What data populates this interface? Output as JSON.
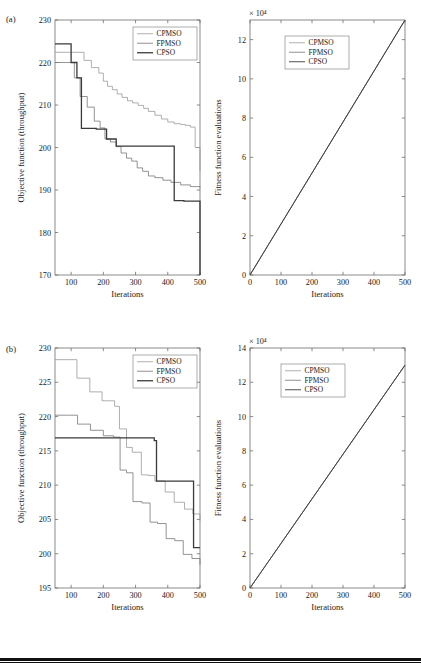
{
  "figure": {
    "panels": [
      {
        "tag": "(a)",
        "left": {
          "ylabel": "Objective function (throughput)",
          "xlabel": "Iterations",
          "xlim": [
            50,
            500
          ],
          "ylim": [
            170,
            230
          ],
          "xticks": [
            100,
            200,
            300,
            400,
            500
          ],
          "yticks": [
            170,
            180,
            190,
            200,
            210,
            220,
            230
          ],
          "legend": [
            "CPMSO",
            "FPMSO",
            "CPSO"
          ]
        },
        "right": {
          "ylabel": "Fitness function evaluations",
          "xlabel": "Iterations",
          "exponent": "× 10⁴",
          "xlim": [
            0,
            500
          ],
          "ylim": [
            0,
            13
          ],
          "xticks": [
            0,
            100,
            200,
            300,
            400,
            500
          ],
          "yticks": [
            0,
            2,
            4,
            6,
            8,
            10,
            12
          ],
          "legend": [
            "CPMSO",
            "FPMSO",
            "CPSO"
          ]
        }
      },
      {
        "tag": "(b)",
        "left": {
          "ylabel": "Objective function (throughput)",
          "xlabel": "Iterations",
          "xlim": [
            50,
            500
          ],
          "ylim": [
            195,
            230
          ],
          "xticks": [
            100,
            200,
            300,
            400,
            500
          ],
          "yticks": [
            195,
            200,
            205,
            210,
            215,
            220,
            225,
            230
          ],
          "legend": [
            "CPMSO",
            "FPMSO",
            "CPSO"
          ]
        },
        "right": {
          "ylabel": "Fitness function evaluations",
          "xlabel": "Iterations",
          "exponent": "× 10⁴",
          "xlim": [
            0,
            500
          ],
          "ylim": [
            0,
            14
          ],
          "xticks": [
            0,
            100,
            200,
            300,
            400,
            500
          ],
          "yticks": [
            0,
            2,
            4,
            6,
            8,
            10,
            12,
            14
          ],
          "legend": [
            "CPMSO",
            "FPMSO",
            "CPSO"
          ]
        }
      }
    ]
  },
  "colors": {
    "cpmso": "#9a9a9a",
    "fpmso": "#777777",
    "cpso": "#3a3a3a",
    "axis": "#6e6e6e",
    "text": "#1a1a1a",
    "rule": "#111111"
  },
  "chart_data": [
    {
      "id": "a-left",
      "type": "line",
      "title": "",
      "subtitle": "(a) convergence of objective function",
      "xlabel": "Iterations",
      "ylabel": "Objective function (throughput)",
      "xlim": [
        50,
        500
      ],
      "ylim": [
        170,
        230
      ],
      "xticks": [
        100,
        200,
        300,
        400,
        500
      ],
      "yticks": [
        170,
        180,
        190,
        200,
        210,
        220,
        230
      ],
      "grid": false,
      "legend_position": "top-right",
      "step": "post",
      "series": [
        {
          "name": "CPMSO",
          "color": "#9a9a9a",
          "linewidth": 0.8,
          "x": [
            50,
            88,
            140,
            163,
            186,
            200,
            213,
            228,
            243,
            258,
            275,
            291,
            308,
            325,
            340,
            360,
            380,
            400,
            420,
            440,
            455,
            470,
            485,
            500
          ],
          "y": [
            222.4,
            222.4,
            220.5,
            218.8,
            217.5,
            215.6,
            214.4,
            213.6,
            212.6,
            211.8,
            211.0,
            210.5,
            209.9,
            209.2,
            208.5,
            207.6,
            206.7,
            206.0,
            205.6,
            205.4,
            205.2,
            204.8,
            200.0,
            194.5
          ]
        },
        {
          "name": "FPMSO",
          "color": "#777777",
          "linewidth": 0.8,
          "x": [
            50,
            82,
            110,
            128,
            150,
            172,
            190,
            205,
            222,
            240,
            255,
            272,
            288,
            305,
            322,
            340,
            360,
            385,
            410,
            440,
            470,
            500
          ],
          "y": [
            220.0,
            220.0,
            216.4,
            212.0,
            209.5,
            206.2,
            204.6,
            202.0,
            201.3,
            200.2,
            198.7,
            197.5,
            196.8,
            195.2,
            194.4,
            193.3,
            192.9,
            192.3,
            191.8,
            191.2,
            190.8,
            190.5
          ]
        },
        {
          "name": "CPSO",
          "color": "#3a3a3a",
          "linewidth": 1.3,
          "x": [
            50,
            88,
            100,
            118,
            132,
            178,
            210,
            240,
            332,
            420,
            450,
            500
          ],
          "y": [
            224.4,
            224.4,
            220.0,
            216.4,
            204.5,
            204.3,
            202.0,
            200.3,
            200.3,
            187.5,
            187.4,
            170.0
          ]
        }
      ]
    },
    {
      "id": "a-right",
      "type": "line",
      "title": "",
      "subtitle": "(a) fitness function evaluations versus iterations",
      "xlabel": "Iterations",
      "ylabel": "Fitness function evaluations",
      "y_exponent": "× 10⁴",
      "xlim": [
        0,
        500
      ],
      "ylim": [
        0,
        13
      ],
      "xticks": [
        0,
        100,
        200,
        300,
        400,
        500
      ],
      "yticks": [
        0,
        2,
        4,
        6,
        8,
        10,
        12
      ],
      "grid": false,
      "legend_position": "upper-left-inset",
      "series": [
        {
          "name": "CPMSO",
          "color": "#9a9a9a",
          "linewidth": 0.8,
          "x": [
            0,
            500
          ],
          "y": [
            0,
            13.0
          ]
        },
        {
          "name": "FPMSO",
          "color": "#777777",
          "linewidth": 0.8,
          "x": [
            0,
            500
          ],
          "y": [
            0,
            13.0
          ]
        },
        {
          "name": "CPSO",
          "color": "#3a3a3a",
          "linewidth": 0.9,
          "x": [
            0,
            500
          ],
          "y": [
            0,
            13.0
          ]
        }
      ]
    },
    {
      "id": "b-left",
      "type": "line",
      "title": "",
      "subtitle": "(b) convergence of objective function",
      "xlabel": "Iterations",
      "ylabel": "Objective function (throughput)",
      "xlim": [
        50,
        500
      ],
      "ylim": [
        195,
        230
      ],
      "xticks": [
        100,
        200,
        300,
        400,
        500
      ],
      "yticks": [
        195,
        200,
        205,
        210,
        215,
        220,
        225,
        230
      ],
      "grid": false,
      "legend_position": "top-right",
      "step": "post",
      "series": [
        {
          "name": "CPMSO",
          "color": "#9a9a9a",
          "linewidth": 0.8,
          "x": [
            50,
            90,
            118,
            158,
            196,
            235,
            250,
            272,
            290,
            318,
            340,
            360,
            392,
            420,
            452,
            478,
            500
          ],
          "y": [
            228.3,
            228.3,
            225.6,
            223.6,
            222.3,
            221.5,
            218.2,
            215.5,
            214.8,
            211.5,
            211.4,
            210.6,
            209.0,
            207.5,
            206.5,
            205.8,
            204.8
          ]
        },
        {
          "name": "FPMSO",
          "color": "#777777",
          "linewidth": 0.8,
          "x": [
            50,
            92,
            120,
            160,
            200,
            232,
            252,
            272,
            292,
            320,
            345,
            368,
            395,
            422,
            448,
            475,
            500
          ],
          "y": [
            220.2,
            220.2,
            218.9,
            218.0,
            217.2,
            217.0,
            212.2,
            211.8,
            207.6,
            207.4,
            204.6,
            204.4,
            202.2,
            201.9,
            199.9,
            199.3,
            198.4
          ]
        },
        {
          "name": "CPSO",
          "color": "#3a3a3a",
          "linewidth": 1.3,
          "x": [
            50,
            355,
            358,
            365,
            478,
            480,
            500
          ],
          "y": [
            216.9,
            216.9,
            216.5,
            210.6,
            210.6,
            200.9,
            200.9
          ]
        }
      ]
    },
    {
      "id": "b-right",
      "type": "line",
      "title": "",
      "subtitle": "(b) fitness function evaluations versus iterations",
      "xlabel": "Iterations",
      "ylabel": "Fitness function evaluations",
      "y_exponent": "× 10⁴",
      "xlim": [
        0,
        500
      ],
      "ylim": [
        0,
        14
      ],
      "xticks": [
        0,
        100,
        200,
        300,
        400,
        500
      ],
      "yticks": [
        0,
        2,
        4,
        6,
        8,
        10,
        12,
        14
      ],
      "grid": false,
      "legend_position": "upper-left-inset",
      "series": [
        {
          "name": "CPMSO",
          "color": "#9a9a9a",
          "linewidth": 0.8,
          "x": [
            0,
            500
          ],
          "y": [
            0,
            13.0
          ]
        },
        {
          "name": "FPMSO",
          "color": "#777777",
          "linewidth": 0.8,
          "x": [
            0,
            500
          ],
          "y": [
            0,
            13.0
          ]
        },
        {
          "name": "CPSO",
          "color": "#3a3a3a",
          "linewidth": 0.9,
          "x": [
            0,
            500
          ],
          "y": [
            0,
            13.0
          ]
        }
      ]
    }
  ]
}
